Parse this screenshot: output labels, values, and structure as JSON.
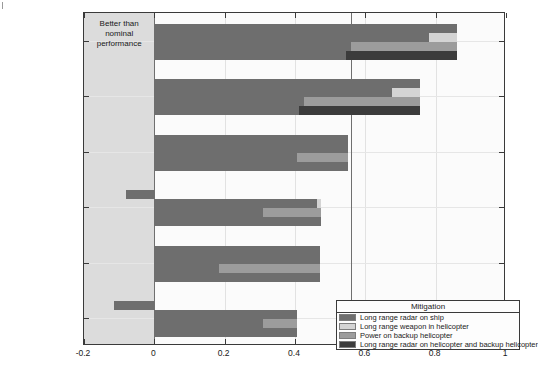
{
  "chart_data": {
    "type": "bar",
    "orientation": "horizontal",
    "title": "",
    "xlabel": "",
    "ylabel": "",
    "xlim": [
      -0.2,
      1
    ],
    "ylim": [
      0,
      6
    ],
    "grid": true,
    "xticks": [
      -0.2,
      0,
      0.2,
      0.4,
      0.6,
      0.8,
      1
    ],
    "xtick_labels": [
      "-0.2",
      "0",
      "0.2",
      "0.4",
      "0.6",
      "0.8",
      "1"
    ],
    "categories": [
      "Sat, UAV and ship",
      "Sat and ship",
      "UAV and ship",
      "Sat, UAV, and heli.",
      "Ship",
      "Sat and UAV"
    ],
    "legend": {
      "title": "Mitigation",
      "position": "lower right",
      "entries": [
        {
          "label": "Long range radar on ship",
          "color": "#6e6e6e"
        },
        {
          "label": "Long range weapon in helicopter",
          "color": "#d4d4d4"
        },
        {
          "label": "Power on backup helicopter",
          "color": "#9c9c9c"
        },
        {
          "label": "Long range radar on helicopter and backup helicopter",
          "color": "#3c3c3c"
        }
      ]
    },
    "regions": [
      {
        "label": "Better than\nnominal\nperformance",
        "from": -0.2,
        "to": 0,
        "shaded": true
      },
      {
        "label": "Acceptable\nperformance",
        "from": 0,
        "to": 0.56,
        "shaded": false
      },
      {
        "label": "Unacceptable\nperformance",
        "from": 0.56,
        "to": 1,
        "shaded": false
      }
    ],
    "series": [
      {
        "name": "Long range radar on ship",
        "color": "#6e6e6e",
        "spans": [
          {
            "category": "Sat, UAV and ship",
            "start": 0,
            "end": 0.86
          },
          {
            "category": "Sat and ship",
            "start": 0,
            "end": 0.755
          },
          {
            "category": "UAV and ship",
            "start": 0,
            "end": 0.55
          },
          {
            "category": "Sat, UAV, and heli.",
            "start": -0.08,
            "end": 0
          },
          {
            "category": "Ship",
            "start": 0,
            "end": 0.47
          },
          {
            "category": "Sat and UAV",
            "start": -0.115,
            "end": 0
          }
        ]
      },
      {
        "name": "Long range weapon in helicopter",
        "color": "#d4d4d4",
        "base_color": "#6e6e6e",
        "spans": [
          {
            "category": "Sat, UAV and ship",
            "start": 0.78,
            "end": 0.86
          },
          {
            "category": "Sat and ship",
            "start": 0.675,
            "end": 0.755
          },
          {
            "category": "UAV and ship",
            "start": 0.55,
            "end": 0.55
          },
          {
            "category": "Sat, UAV, and heli.",
            "start": 0.463,
            "end": 0.475
          },
          {
            "category": "Ship",
            "start": 0.47,
            "end": 0.47
          },
          {
            "category": "Sat and UAV",
            "start": 0.405,
            "end": 0.405
          }
        ]
      },
      {
        "name": "Power on backup helicopter",
        "color": "#9c9c9c",
        "base_color": "#6e6e6e",
        "spans": [
          {
            "category": "Sat, UAV and ship",
            "start": 0.56,
            "end": 0.86
          },
          {
            "category": "Sat and ship",
            "start": 0.425,
            "end": 0.755
          },
          {
            "category": "UAV and ship",
            "start": 0.405,
            "end": 0.55
          },
          {
            "category": "Sat, UAV, and heli.",
            "start": 0.31,
            "end": 0.475
          },
          {
            "category": "Ship",
            "start": 0.185,
            "end": 0.47
          },
          {
            "category": "Sat and UAV",
            "start": 0.31,
            "end": 0.405
          }
        ]
      },
      {
        "name": "Long range radar on helicopter and backup helicopter",
        "color": "#3c3c3c",
        "base_color": "#6e6e6e",
        "spans": [
          {
            "category": "Sat, UAV and ship",
            "start": 0.545,
            "end": 0.86
          },
          {
            "category": "Sat and ship",
            "start": 0.41,
            "end": 0.755
          },
          {
            "category": "UAV and ship",
            "start": 0.55,
            "end": 0.55
          },
          {
            "category": "Sat, UAV, and heli.",
            "start": 0.475,
            "end": 0.475
          },
          {
            "category": "Ship",
            "start": 0.47,
            "end": 0.47
          },
          {
            "category": "Sat and UAV",
            "start": 0.405,
            "end": 0.405
          }
        ]
      }
    ]
  },
  "style": {
    "shade_color": "#dcdcdc",
    "plot_bg": "#fbfbfb",
    "axis_color": "#3a3a3a",
    "grid_color": "#e2e2e2",
    "divider_color": "#6f6f6f"
  }
}
